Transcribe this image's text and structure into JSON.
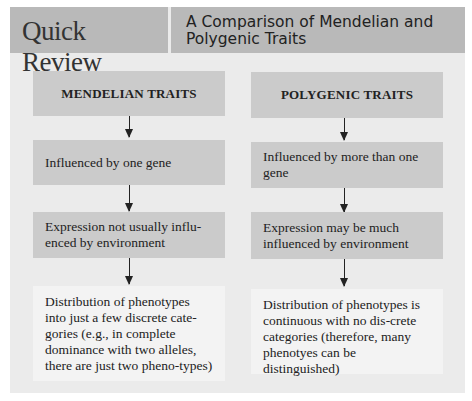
{
  "header": {
    "badge": "Quick Review",
    "title": "A Comparison of Mendelian and Polygenic Traits"
  },
  "columns": [
    {
      "title": "MENDELIAN TRAITS",
      "items": [
        "Influenced by one gene",
        "Expression not usually influ-enced by environment",
        "Distribution of phenotypes into just a few discrete cate-gories (e.g., in complete dominance with two alleles, there are just two pheno-types)"
      ]
    },
    {
      "title": "POLYGENIC TRAITS",
      "items": [
        "Influenced by more than one gene",
        "Expression may be much influenced by environment",
        "Distribution of phenotypes is continuous with no dis-crete categories (therefore, many phenotyes can be distinguished)"
      ]
    }
  ],
  "colors": {
    "header_bg": "#b9b9b9",
    "panel_bg": "#ebebeb",
    "box_bg": "#cbcbcb",
    "last_box_bg": "#f3f3f3"
  }
}
